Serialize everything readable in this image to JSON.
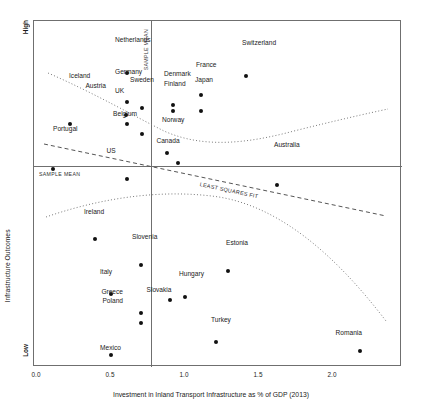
{
  "chart_data": {
    "type": "scatter",
    "title": "",
    "xlabel": "Investment in Inland Transport Infrastructure as % of GDP (2013)",
    "ylabel": "Infrastructure Outcomes",
    "ylim_labels": {
      "high": "High",
      "low": "Low"
    },
    "xlim": [
      -0.04,
      2.32
    ],
    "xticks": [
      0.0,
      0.5,
      1.0,
      1.5,
      2.0
    ],
    "xtick_labels": [
      "0.0",
      "0.5",
      "1.0",
      "1.5",
      "2.0"
    ],
    "grid": false,
    "legend": "none",
    "annotations": [
      {
        "name": "sample-mean-vertical",
        "text": "SAMPLE MEAN",
        "x": 0.86,
        "orientation": "vertical"
      },
      {
        "name": "sample-mean-horizontal",
        "text": "SAMPLE MEAN",
        "y": 0.42,
        "orientation": "horizontal"
      },
      {
        "name": "least-squares-fit",
        "text": "LEAST SQUARES FIT"
      }
    ],
    "points": [
      {
        "label": "Netherlands",
        "x": 0.61,
        "y": 0.9,
        "lx": 114,
        "ly": 39,
        "anchor": "r"
      },
      {
        "label": "Switzerland",
        "x": 1.41,
        "y": 0.89,
        "lx": 241,
        "ly": 42,
        "anchor": "r"
      },
      {
        "label": "France",
        "x": 1.11,
        "y": 0.83,
        "lx": 195,
        "ly": 64,
        "anchor": "r"
      },
      {
        "label": "Germany",
        "x": 0.61,
        "y": 0.81,
        "lx": 114,
        "ly": 71,
        "anchor": "r"
      },
      {
        "label": "Denmark",
        "x": 0.92,
        "y": 0.8,
        "lx": 163,
        "ly": 73,
        "anchor": "r"
      },
      {
        "label": "Sweden",
        "x": 0.71,
        "y": 0.79,
        "lx": 129,
        "ly": 79,
        "anchor": "r"
      },
      {
        "label": "Finland",
        "x": 0.92,
        "y": 0.78,
        "lx": 163,
        "ly": 83,
        "anchor": "r"
      },
      {
        "label": "Japan",
        "x": 1.11,
        "y": 0.78,
        "lx": 194,
        "ly": 79,
        "anchor": "r"
      },
      {
        "label": "Austria",
        "x": 0.6,
        "y": 0.77,
        "lx": 105,
        "ly": 85,
        "anchor": "l"
      },
      {
        "label": "Iceland",
        "x": 0.22,
        "y": 0.74,
        "lx": 68,
        "ly": 75,
        "anchor": "r"
      },
      {
        "label": "UK",
        "x": 0.61,
        "y": 0.74,
        "lx": 114,
        "ly": 90,
        "anchor": "r"
      },
      {
        "label": "Belgium",
        "x": 0.71,
        "y": 0.71,
        "lx": 124,
        "ly": 110,
        "anchor": "b"
      },
      {
        "label": "Norway",
        "x": 0.88,
        "y": 0.65,
        "lx": 161,
        "ly": 119,
        "anchor": "r"
      },
      {
        "label": "Canada",
        "x": 0.95,
        "y": 0.62,
        "lx": 167,
        "ly": 137,
        "anchor": "b"
      },
      {
        "label": "Portugal",
        "x": 0.11,
        "y": 0.6,
        "lx": 52,
        "ly": 128,
        "anchor": "r"
      },
      {
        "label": "US",
        "x": 0.61,
        "y": 0.57,
        "lx": 110,
        "ly": 147,
        "anchor": "b"
      },
      {
        "label": "Australia",
        "x": 1.62,
        "y": 0.55,
        "lx": 273,
        "ly": 144,
        "anchor": "r"
      },
      {
        "label": "Ireland",
        "x": 0.39,
        "y": 0.38,
        "lx": 83,
        "ly": 211,
        "anchor": "r"
      },
      {
        "label": "Slovenia",
        "x": 0.7,
        "y": 0.3,
        "lx": 131,
        "ly": 236,
        "anchor": "r"
      },
      {
        "label": "Estonia",
        "x": 1.29,
        "y": 0.28,
        "lx": 225,
        "ly": 242,
        "anchor": "r"
      },
      {
        "label": "Italy",
        "x": 0.5,
        "y": 0.21,
        "lx": 99,
        "ly": 271,
        "anchor": "r"
      },
      {
        "label": "Hungary",
        "x": 1.0,
        "y": 0.2,
        "lx": 178,
        "ly": 273,
        "anchor": "r"
      },
      {
        "label": "Slovakia",
        "x": 0.9,
        "y": 0.19,
        "lx": 158,
        "ly": 286,
        "anchor": "b"
      },
      {
        "label": "Greece",
        "x": 0.7,
        "y": 0.15,
        "lx": 122,
        "ly": 291,
        "anchor": "l"
      },
      {
        "label": "Poland",
        "x": 0.7,
        "y": 0.12,
        "lx": 122,
        "ly": 300,
        "anchor": "l"
      },
      {
        "label": "Turkey",
        "x": 1.21,
        "y": 0.06,
        "lx": 210,
        "ly": 319,
        "anchor": "r"
      },
      {
        "label": "Romania",
        "x": 2.18,
        "y": 0.03,
        "lx": 361,
        "ly": 332,
        "anchor": "l"
      },
      {
        "label": "Mexico",
        "x": 0.5,
        "y": 0.02,
        "lx": 99,
        "ly": 347,
        "anchor": "r"
      }
    ]
  },
  "axis": {
    "x_title": "Investment in Inland Transport Infrastructure as % of GDP (2013)",
    "y_title": "Infrastructure Outcomes",
    "y_high": "High",
    "y_low": "Low",
    "ticks": [
      "0.0",
      "0.5",
      "1.0",
      "1.5",
      "2.0"
    ]
  },
  "labels": {
    "sample_mean_vertical": "SAMPLE MEAN",
    "sample_mean_horizontal": "SAMPLE MEAN",
    "least_squares_fit": "LEAST SQUARES FIT"
  },
  "colors": {
    "point": "#111111",
    "frame": "#6f6f6f",
    "fit_line": "#555555",
    "dotted_line": "#7a7a7a",
    "text": "#1b1b1b"
  }
}
